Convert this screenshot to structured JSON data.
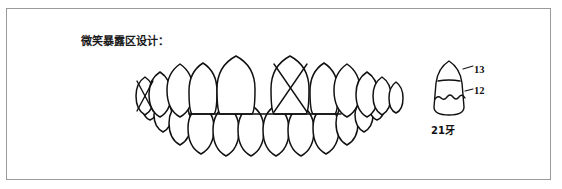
{
  "figure": {
    "caption": "微笑暴露区设计：",
    "border_color": "#9a9a9a",
    "background_color": "#ffffff",
    "ink_color": "#111111"
  },
  "dentition": {
    "name": "anterior-dentition-frontal-view",
    "description": "上下前牙正面观",
    "marked_teeth": [
      "upper-left-canine-region",
      "upper-right-central-incisor"
    ],
    "mark_symbol": "X"
  },
  "single_tooth": {
    "name": "tooth-21-zone-diagram",
    "label_bottom": "21牙",
    "zone_upper": "13",
    "zone_lower": "12"
  }
}
